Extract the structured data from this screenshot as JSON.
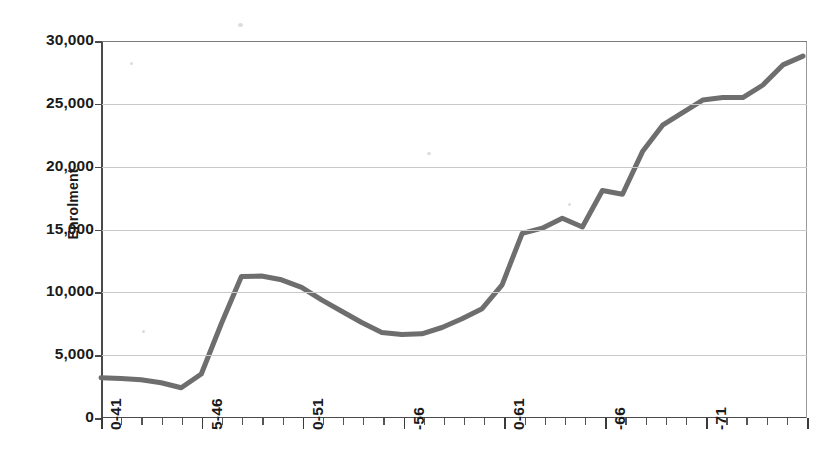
{
  "chart_data": {
    "type": "line",
    "title": "",
    "subtitle": "",
    "xlabel": "",
    "ylabel": "Enrolment",
    "ylim": [
      0,
      30000
    ],
    "ytick_labels": [
      "30,000",
      "25,000",
      "20,000",
      "15,000",
      "10,000",
      "5,000",
      "0"
    ],
    "ytick_values": [
      30000,
      25000,
      20000,
      15000,
      10000,
      5000,
      0
    ],
    "grid": true,
    "legend": "none",
    "line_color": "#6e6e6e",
    "line_width": 5,
    "categories": [
      "1940-41",
      "1941-42",
      "1942-43",
      "1943-44",
      "1944-45",
      "1945-46",
      "1946-47",
      "1947-48",
      "1948-49",
      "1949-50",
      "1950-51",
      "1951-52",
      "1952-53",
      "1953-54",
      "1954-55",
      "1955-56",
      "1956-57",
      "1957-58",
      "1958-59",
      "1959-60",
      "1960-61",
      "1961-62",
      "1962-63",
      "1963-64",
      "1964-65",
      "1965-66",
      "1966-67",
      "1967-68",
      "1968-69",
      "1969-70",
      "1970-71"
    ],
    "xtick_labels_shown": [
      "0-41",
      "5-46",
      "0-51",
      "-56",
      "0-61",
      "-66",
      "-71"
    ],
    "xtick_label_indices": [
      0,
      5,
      10,
      15,
      20,
      25,
      30
    ],
    "values": [
      3200,
      3150,
      3050,
      2800,
      2400,
      3500,
      7500,
      11250,
      11300,
      11000,
      10400,
      9400,
      8500,
      7600,
      6800,
      6650,
      6700,
      7200,
      7900,
      8700,
      10600,
      14700,
      15100,
      15900,
      15200,
      18100,
      17800,
      21200,
      23300,
      24300,
      25300
    ],
    "values_right_tail": [
      25500,
      25500,
      26500,
      28100,
      28800
    ],
    "series_name": "Enrolment"
  },
  "axis": {
    "y_title": "Enrolment"
  }
}
